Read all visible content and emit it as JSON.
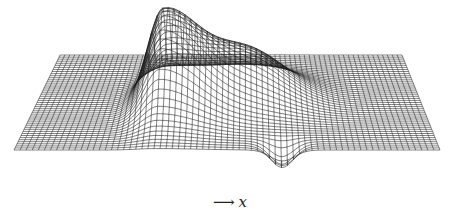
{
  "figure": {
    "type": "3d-wireframe-surface",
    "axis_label": {
      "arrow": "⟶",
      "variable": "x"
    },
    "colors": {
      "line": "#1a1a1a",
      "background": "#ffffff"
    },
    "grid": {
      "rows": 46,
      "cols": 70
    },
    "plane": {
      "back_left": [
        60,
        55
      ],
      "back_right": [
        402,
        55
      ],
      "front_left": [
        14,
        150
      ],
      "front_right": [
        440,
        150
      ]
    },
    "features": [
      {
        "kind": "peak",
        "u": 0.33,
        "v": 0.55,
        "height": 95,
        "su": 0.07,
        "sv": 0.22
      },
      {
        "kind": "ridge",
        "u": 0.55,
        "v": 0.45,
        "height": 45,
        "su": 0.14,
        "sv": 0.2
      },
      {
        "kind": "trough",
        "u": 0.63,
        "v": 0.95,
        "height": -22,
        "su": 0.04,
        "sv": 0.06
      }
    ]
  }
}
